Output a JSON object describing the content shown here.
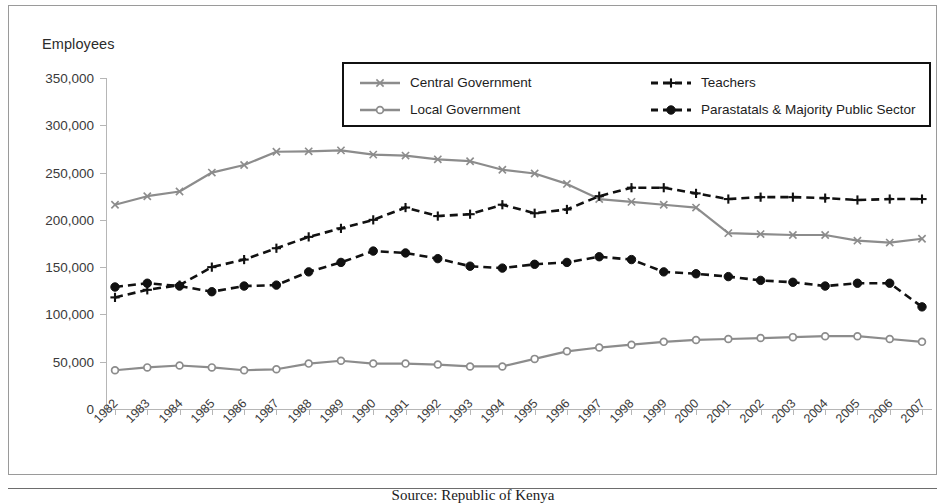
{
  "figure": {
    "y_axis_title": "Employees",
    "caption": "Source: Republic of Kenya"
  },
  "legend": {
    "entries": [
      {
        "label": "Central Government",
        "marker": "x-marker",
        "style": "solid",
        "color": "#8c8c8c"
      },
      {
        "label": "Local Government",
        "marker": "circle-open-marker",
        "style": "solid",
        "color": "#8c8c8c"
      },
      {
        "label": "Teachers",
        "marker": "plus-marker",
        "style": "dashed",
        "color": "#111111"
      },
      {
        "label": "Parastatals & Majority Public Sector",
        "marker": "circle-filled-marker",
        "style": "dashed",
        "color": "#111111"
      }
    ]
  },
  "chart_data": {
    "type": "line",
    "title": "",
    "xlabel": "",
    "ylabel": "Employees",
    "ylim": [
      0,
      350000
    ],
    "ytick_labels": [
      "350,000",
      "300,000",
      "250,000",
      "200,000",
      "150,000",
      "100,000",
      "50,000",
      "0"
    ],
    "yticks": [
      350000,
      300000,
      250000,
      200000,
      150000,
      100000,
      50000,
      0
    ],
    "grid": false,
    "legend_position": "top-center",
    "categories": [
      "1982",
      "1983",
      "1984",
      "1985",
      "1986",
      "1987",
      "1988",
      "1989",
      "1990",
      "1991",
      "1992",
      "1993",
      "1994",
      "1995",
      "1996",
      "1997",
      "1998",
      "1999",
      "2000",
      "2001",
      "2002",
      "2003",
      "2004",
      "2005",
      "2006",
      "2007"
    ],
    "series": [
      {
        "name": "Central Government",
        "color": "#8c8c8c",
        "style": "solid",
        "marker": "x",
        "values": [
          216000,
          225000,
          230000,
          250000,
          258000,
          272000,
          272500,
          273500,
          269000,
          268000,
          264000,
          262000,
          253000,
          249000,
          238000,
          222000,
          219000,
          216000,
          213000,
          186000,
          185000,
          184000,
          184000,
          178000,
          176000,
          180000
        ]
      },
      {
        "name": "Local Government",
        "color": "#8c8c8c",
        "style": "solid",
        "marker": "circle-open",
        "values": [
          41000,
          44000,
          46000,
          44000,
          41000,
          42000,
          48000,
          51000,
          48000,
          48000,
          47000,
          45000,
          45000,
          53000,
          61000,
          65000,
          68000,
          71000,
          73000,
          74000,
          75000,
          76000,
          77000,
          77000,
          74000,
          71000
        ]
      },
      {
        "name": "Teachers",
        "color": "#111111",
        "style": "dashed",
        "marker": "plus",
        "values": [
          118000,
          126000,
          131000,
          150000,
          158000,
          170000,
          182000,
          191000,
          200000,
          213000,
          204000,
          206000,
          216000,
          207000,
          211000,
          225000,
          234000,
          234000,
          228000,
          222000,
          224000,
          224000,
          223000,
          221000,
          222000,
          222000
        ]
      },
      {
        "name": "Parastatals & Majority Public Sector",
        "color": "#111111",
        "style": "dashed",
        "marker": "circle-filled",
        "values": [
          129000,
          133000,
          130000,
          124000,
          130000,
          131000,
          145000,
          155000,
          167000,
          165000,
          159000,
          151000,
          149000,
          153000,
          155000,
          161000,
          158000,
          145000,
          143000,
          140000,
          136000,
          134000,
          130000,
          133000,
          133000,
          108000
        ]
      }
    ]
  }
}
